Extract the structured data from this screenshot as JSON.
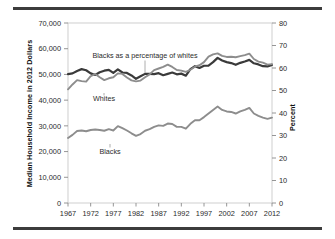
{
  "chart_data": {
    "type": "line",
    "title": "",
    "subtitle": "",
    "xlabel": "",
    "ylabel": "Median Household Income in 2012 Dollars",
    "ylabel_right": "Percent",
    "grid": false,
    "legend_position": "inline-annotations",
    "xlim": [
      1967,
      2012
    ],
    "ylim": [
      0,
      70000
    ],
    "ylim_right": [
      0,
      80
    ],
    "yticks": [
      "0",
      "10,000",
      "20,000",
      "30,000",
      "40,000",
      "50,000",
      "60,000",
      "70,000"
    ],
    "ytick_values": [
      0,
      10000,
      20000,
      30000,
      40000,
      50000,
      60000,
      70000
    ],
    "yticks_right": [
      "0",
      "10",
      "20",
      "30",
      "40",
      "50",
      "60",
      "70",
      "80"
    ],
    "ytick_values_right": [
      0,
      10,
      20,
      30,
      40,
      50,
      60,
      70,
      80
    ],
    "xticks": [
      "1967",
      "1972",
      "1977",
      "1982",
      "1987",
      "1992",
      "1997",
      "2002",
      "2007",
      "2012"
    ],
    "xtick_values": [
      1967,
      1972,
      1977,
      1982,
      1987,
      1992,
      1997,
      2002,
      2007,
      2012
    ],
    "x": [
      1967,
      1968,
      1969,
      1970,
      1971,
      1972,
      1973,
      1974,
      1975,
      1976,
      1977,
      1978,
      1979,
      1980,
      1981,
      1982,
      1983,
      1984,
      1985,
      1986,
      1987,
      1988,
      1989,
      1990,
      1991,
      1992,
      1993,
      1994,
      1995,
      1996,
      1997,
      1998,
      1999,
      2000,
      2001,
      2002,
      2003,
      2004,
      2005,
      2006,
      2007,
      2008,
      2009,
      2010,
      2011,
      2012
    ],
    "series": [
      {
        "name": "Blacks as a percentage of whites",
        "axis": "right",
        "units": "percent",
        "color": "#3a3a3a",
        "values": [
          57.3,
          57.6,
          58.7,
          59.5,
          59.0,
          57.6,
          56.9,
          58.1,
          58.8,
          59.2,
          57.8,
          59.4,
          58.0,
          57.8,
          56.7,
          55.2,
          56.3,
          57.4,
          57.4,
          57.3,
          57.7,
          56.8,
          57.4,
          58.0,
          57.2,
          57.5,
          56.6,
          59.5,
          60.8,
          60.0,
          61.0,
          61.1,
          62.6,
          64.5,
          63.3,
          62.6,
          62.2,
          61.4,
          62.3,
          62.9,
          63.6,
          62.1,
          61.6,
          60.8,
          60.7,
          61.4
        ]
      },
      {
        "name": "Whites",
        "axis": "left",
        "units": "2012 dollars",
        "color": "#8d8d8d",
        "values": [
          44200,
          46100,
          47800,
          47400,
          47200,
          49300,
          50200,
          48900,
          47800,
          48500,
          48900,
          50400,
          50200,
          48800,
          47700,
          47300,
          47600,
          48900,
          50000,
          51700,
          52300,
          52900,
          53800,
          52900,
          51700,
          51500,
          51000,
          51800,
          53000,
          53600,
          54800,
          56900,
          57800,
          58200,
          57200,
          56800,
          56900,
          56700,
          57100,
          57500,
          58100,
          56000,
          55000,
          54600,
          53800,
          54000
        ]
      },
      {
        "name": "Blacks",
        "axis": "left",
        "units": "2012 dollars",
        "color": "#8d8d8d",
        "values": [
          25300,
          26500,
          28000,
          28200,
          27900,
          28400,
          28600,
          28400,
          28100,
          28700,
          28200,
          29900,
          29100,
          28200,
          27100,
          26100,
          26800,
          28100,
          28700,
          29600,
          30200,
          30000,
          30900,
          30700,
          29600,
          29600,
          28900,
          30800,
          32200,
          32200,
          33400,
          34800,
          36200,
          37500,
          36200,
          35600,
          35400,
          34800,
          35600,
          36200,
          37000,
          34800,
          33900,
          33200,
          32700,
          33200
        ]
      }
    ],
    "annotations": [
      {
        "text": "Blacks as a percentage of whites",
        "target_series": "Blacks as a percentage of whites"
      },
      {
        "text": "Whites",
        "target_series": "Whites"
      },
      {
        "text": "Blacks",
        "target_series": "Blacks"
      }
    ]
  },
  "figure": {
    "axis_title_left": "Median Household Income in 2012 Dollars",
    "axis_title_right": "Percent"
  }
}
